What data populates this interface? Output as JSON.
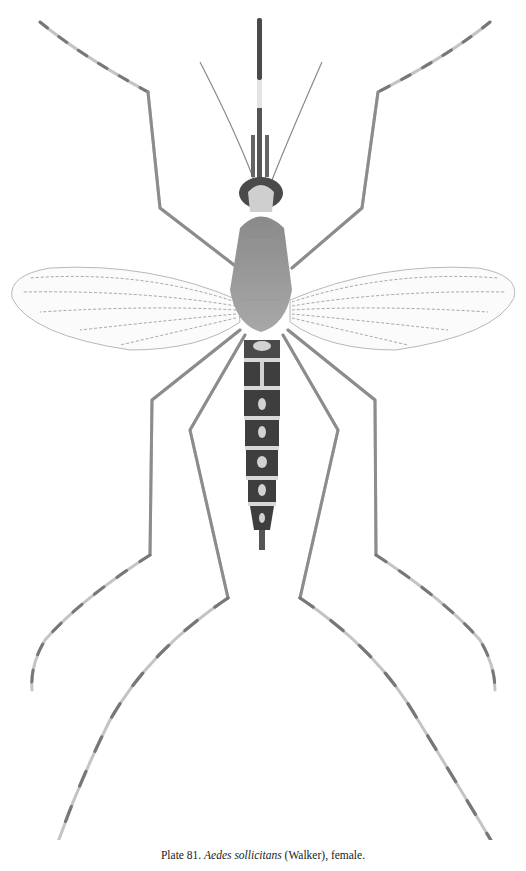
{
  "figure": {
    "style": "grayscale stipple drawing, dorsal view"
  },
  "caption": {
    "plate_label": "Plate 81.",
    "species": "Aedes sollicitans",
    "authority": "(Walker),",
    "sex": "female."
  },
  "colors": {
    "background": "#ffffff",
    "ink_dark": "#3a3a3a",
    "ink_mid": "#6e6e6e",
    "ink_light": "#b4b4b4"
  }
}
